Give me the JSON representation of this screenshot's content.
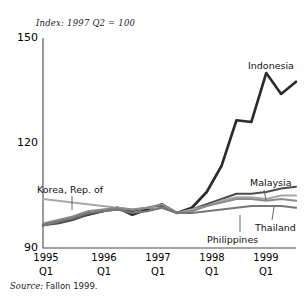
{
  "figure": {
    "index_note": "Index: 1997 Q2 = 100",
    "source": "Source: Fallon 1999.",
    "source_label": "Source:",
    "source_text": "Fallon 1999."
  },
  "chart_data": {
    "type": "line",
    "title": "Index: 1997 Q2 = 100",
    "subtitle": "",
    "xlabel": "",
    "ylabel": "",
    "ylim": [
      90,
      150
    ],
    "yticks": [
      90,
      120,
      150
    ],
    "ytick_labels": [
      "90",
      "120",
      "150"
    ],
    "grid": false,
    "legend_position": "inline-labels",
    "note": "Source: Fallon 1999.",
    "x": [
      "1995 Q1",
      "1995 Q2",
      "1995 Q3",
      "1995 Q4",
      "1996 Q1",
      "1996 Q2",
      "1996 Q3",
      "1996 Q4",
      "1997 Q1",
      "1997 Q2",
      "1997 Q3",
      "1997 Q4",
      "1998 Q1",
      "1998 Q2",
      "1998 Q3",
      "1998 Q4",
      "1999 Q1",
      "1999 Q2"
    ],
    "xtick_years": [
      "1995",
      "1996",
      "1997",
      "1998",
      "1999"
    ],
    "xtick_quarters": [
      "Q1",
      "Q1",
      "Q1",
      "Q1",
      "Q1"
    ],
    "series": [
      {
        "name": "Indonesia",
        "color": "#2b2b2b",
        "width": 2.6,
        "values": [
          96.5,
          97.5,
          98.5,
          99.5,
          100.5,
          101.5,
          99.5,
          101.0,
          102.5,
          100.0,
          101.5,
          106.0,
          113.5,
          126.5,
          126.0,
          140.0,
          134.0,
          137.5
        ]
      },
      {
        "name": "Malaysia",
        "color": "#4d4d4d",
        "width": 2.2,
        "values": [
          96.5,
          97.0,
          98.0,
          99.5,
          100.5,
          101.0,
          100.5,
          101.5,
          102.0,
          100.0,
          101.0,
          102.5,
          104.0,
          105.5,
          105.5,
          106.0,
          107.0,
          107.5
        ]
      },
      {
        "name": "Korea, Rep. of",
        "color": "#a8a8a8",
        "width": 2.2,
        "values": [
          104.0,
          103.5,
          103.0,
          102.5,
          102.0,
          101.5,
          101.0,
          101.5,
          101.5,
          100.0,
          101.0,
          102.0,
          103.5,
          104.5,
          104.5,
          104.0,
          105.0,
          105.0
        ]
      },
      {
        "name": "Thailand",
        "color": "#8c8c8c",
        "width": 2.2,
        "values": [
          97.0,
          98.0,
          99.0,
          100.5,
          101.0,
          101.5,
          101.0,
          101.5,
          102.5,
          100.0,
          100.5,
          102.0,
          103.0,
          104.0,
          104.0,
          103.5,
          104.0,
          103.5
        ]
      },
      {
        "name": "Philippines",
        "color": "#777777",
        "width": 2.2,
        "values": [
          96.5,
          97.5,
          98.5,
          100.0,
          100.5,
          101.0,
          100.0,
          100.5,
          101.5,
          100.0,
          100.0,
          100.5,
          101.0,
          101.5,
          102.0,
          102.0,
          102.0,
          101.5
        ]
      }
    ],
    "annotations": [
      {
        "text": "Indonesia",
        "x": 248,
        "y": 60
      },
      {
        "text": "Malaysia",
        "x": 250,
        "y": 177
      },
      {
        "text": "Thailand",
        "x": 255,
        "y": 222
      },
      {
        "text": "Philippines",
        "x": 207,
        "y": 234
      },
      {
        "text": "Korea, Rep. of",
        "x": 37,
        "y": 184
      }
    ]
  }
}
